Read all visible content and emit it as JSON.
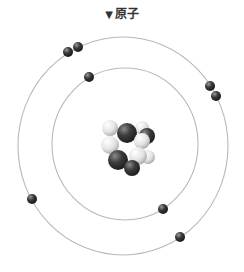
{
  "title": {
    "marker": "▼",
    "label": "原子"
  },
  "diagram": {
    "orbits": [
      {
        "name": "inner-shell",
        "cx": 125,
        "cy": 144,
        "rx": 73,
        "ry": 76
      },
      {
        "name": "outer-shell",
        "cx": 123,
        "cy": 146,
        "rx": 105,
        "ry": 109
      }
    ],
    "electrons": [
      {
        "x": 68,
        "y": 52
      },
      {
        "x": 78,
        "y": 47
      },
      {
        "x": 89,
        "y": 77
      },
      {
        "x": 210,
        "y": 86
      },
      {
        "x": 216,
        "y": 96
      },
      {
        "x": 32,
        "y": 199
      },
      {
        "x": 163,
        "y": 209
      },
      {
        "x": 180,
        "y": 237
      }
    ],
    "nucleus": {
      "cx": 130,
      "cy": 147,
      "particles": [
        {
          "x": 110,
          "y": 128,
          "r": 8,
          "type": "light"
        },
        {
          "x": 142,
          "y": 128,
          "r": 7,
          "type": "light"
        },
        {
          "x": 147,
          "y": 136,
          "r": 8,
          "type": "dark"
        },
        {
          "x": 127,
          "y": 133,
          "r": 10,
          "type": "dark"
        },
        {
          "x": 110,
          "y": 145,
          "r": 9,
          "type": "light"
        },
        {
          "x": 142,
          "y": 141,
          "r": 8,
          "type": "light"
        },
        {
          "x": 148,
          "y": 157,
          "r": 7,
          "type": "light"
        },
        {
          "x": 118,
          "y": 160,
          "r": 10,
          "type": "dark"
        },
        {
          "x": 138,
          "y": 156,
          "r": 9,
          "type": "light"
        },
        {
          "x": 132,
          "y": 168,
          "r": 8,
          "type": "dark"
        }
      ]
    },
    "colors": {
      "orbit": "#b8b8b8",
      "electron": "#3a3a3a",
      "proton": "#3b3b3b",
      "neutron": "#e6e6e6"
    }
  }
}
